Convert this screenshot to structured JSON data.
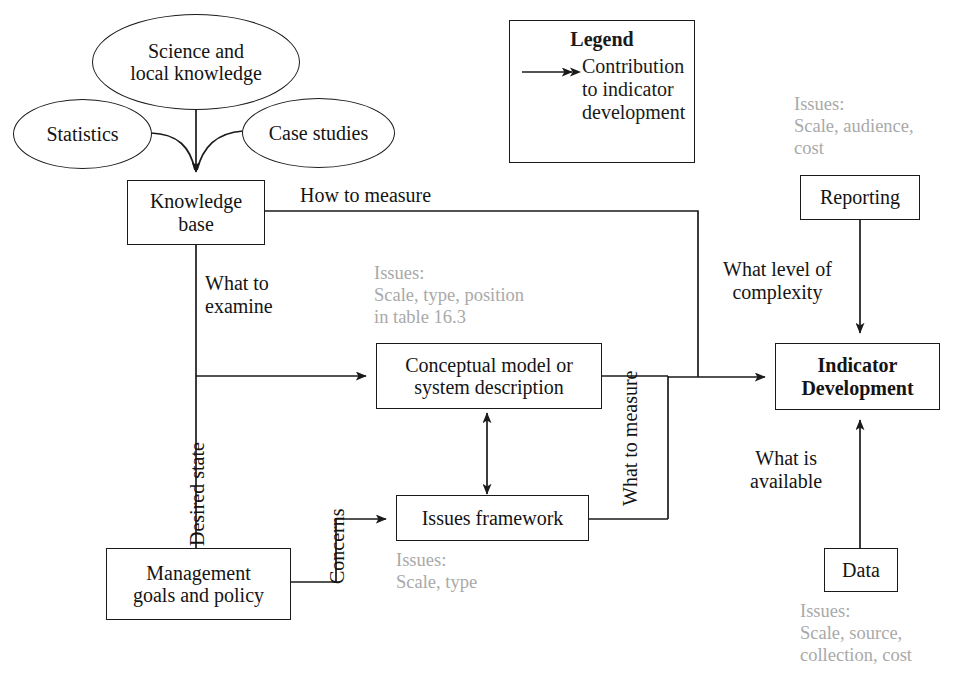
{
  "diagram": {
    "legend": {
      "name": "legend",
      "title": "Legend",
      "arrow_icon": "arrow-right-icon",
      "entry": "Contribution\nto indicator\ndevelopment"
    },
    "nodes": {
      "science": {
        "label": "Science and\nlocal knowledge",
        "shape": "ellipse"
      },
      "statistics": {
        "label": "Statistics",
        "shape": "ellipse"
      },
      "case_studies": {
        "label": "Case studies",
        "shape": "ellipse"
      },
      "knowledge_base": {
        "label": "Knowledge\nbase",
        "shape": "box"
      },
      "conceptual_model": {
        "label": "Conceptual model or\nsystem description",
        "shape": "box"
      },
      "issues_framework": {
        "label": "Issues framework",
        "shape": "box"
      },
      "management": {
        "label": "Management\ngoals and policy",
        "shape": "box"
      },
      "reporting": {
        "label": "Reporting",
        "shape": "box"
      },
      "indicator_development": {
        "label": "Indicator\nDevelopment",
        "shape": "box",
        "bold": true
      },
      "data": {
        "label": "Data",
        "shape": "box"
      }
    },
    "edge_labels": {
      "how_to_measure": "How to measure",
      "what_to_examine": "What to\nexamine",
      "desired_state": "Desired state",
      "concerns": "Concerns",
      "what_to_measure": "What to\nmeasure",
      "what_level_of_complexity": "What level of\ncomplexity",
      "what_is_available": "What is\navailable"
    },
    "issues_notes": {
      "conceptual_model": "Issues:\nScale, type, position\nin table 16.3",
      "issues_framework": "Issues:\nScale, type",
      "reporting": "Issues:\nScale, audience,\ncost",
      "data": "Issues:\nScale, source,\ncollection, cost"
    },
    "colors": {
      "ink": "#1a1a1a",
      "note_gray": "#a9a9a9",
      "background": "#ffffff"
    }
  }
}
